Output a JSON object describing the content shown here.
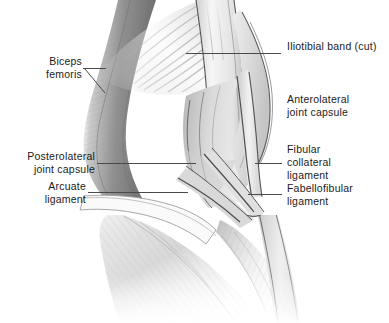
{
  "figure": {
    "type": "anatomical-illustration",
    "width": 389,
    "height": 323,
    "background_color": "#ffffff",
    "line_color": "#4a4a4a",
    "text_color": "#1b1b1b",
    "shading_palette": [
      "#ffffff",
      "#f2f2f2",
      "#dcdcdc",
      "#c2c2c2",
      "#a8a8a8",
      "#8c8c8c",
      "#6e6e6e",
      "#555555"
    ]
  },
  "labels": [
    {
      "id": "iliotibial-band",
      "text": "Iliotibial band (cut)",
      "align": "left",
      "x": 287,
      "y": 46,
      "leader": {
        "x1": 186,
        "y1": 53,
        "x2": 281,
        "y2": 53
      }
    },
    {
      "id": "biceps-femoris",
      "text": "Biceps\nfemoris",
      "align": "right",
      "x": 38,
      "y": 61,
      "leader": {
        "x1": 83,
        "y1": 68,
        "x2": 106,
        "y2": 68
      },
      "leader2": {
        "x1": 85,
        "y1": 69,
        "x2": 104,
        "y2": 92
      }
    },
    {
      "id": "anterolateral-joint-capsule",
      "text": "Anterolateral\njoint capsule",
      "align": "left",
      "x": 287,
      "y": 99,
      "leader": null
    },
    {
      "id": "posterolateral-joint-capsule",
      "text": "Posterolateral\njoint capsule",
      "align": "right",
      "x": 12,
      "y": 156,
      "leader": {
        "x1": 97,
        "y1": 163,
        "x2": 196,
        "y2": 163
      }
    },
    {
      "id": "fibular-collateral-ligament",
      "text": "Fibular\ncollateral\nligament",
      "align": "left",
      "x": 287,
      "y": 149,
      "leader": {
        "x1": 255,
        "y1": 163,
        "x2": 282,
        "y2": 163
      }
    },
    {
      "id": "arcuate-ligament",
      "text": "Arcuate\nligament",
      "align": "right",
      "x": 12,
      "y": 186,
      "leader": {
        "x1": 88,
        "y1": 192,
        "x2": 188,
        "y2": 192
      }
    },
    {
      "id": "fabellofibular-ligament",
      "text": "Fabellofibular\nligament",
      "align": "left",
      "x": 287,
      "y": 188,
      "leader": {
        "x1": 248,
        "y1": 194,
        "x2": 282,
        "y2": 194
      }
    }
  ]
}
